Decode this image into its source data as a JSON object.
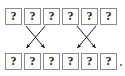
{
  "diagram": {
    "type": "two-row-crossing-arrows",
    "colors": {
      "background": "#ffffff",
      "box_border": "#8a8a8a",
      "box_fill": "#fdfdfd",
      "glyph": "#1a1a1a",
      "arrow": "#1a1a1a",
      "dot": "#555555"
    },
    "top_row": {
      "label": "top-row",
      "count": 6,
      "cells": [
        {
          "label": "?"
        },
        {
          "label": "?"
        },
        {
          "label": "?"
        },
        {
          "label": "?"
        },
        {
          "label": "?"
        },
        {
          "label": "?"
        }
      ]
    },
    "bottom_row": {
      "label": "bottom-row",
      "count": 6,
      "cells": [
        {
          "label": "?"
        },
        {
          "label": "?"
        },
        {
          "label": "?"
        },
        {
          "label": "?"
        },
        {
          "label": "?"
        },
        {
          "label": "?"
        }
      ]
    },
    "arrows": {
      "count": 4,
      "items": [
        {
          "name": "arrow-2-to-4",
          "from_index": 2,
          "to_index": 4,
          "direction": "down-right"
        },
        {
          "name": "arrow-4-to-2",
          "from_index": 4,
          "to_index": 2,
          "direction": "down-left"
        },
        {
          "name": "arrow-4b-to-6",
          "from_index": 4,
          "to_index": 6,
          "direction": "down-right"
        },
        {
          "name": "arrow-6-to-4b",
          "from_index": 6,
          "to_index": 4,
          "direction": "down-left"
        }
      ]
    },
    "trailing_mark": {
      "label": "."
    }
  }
}
